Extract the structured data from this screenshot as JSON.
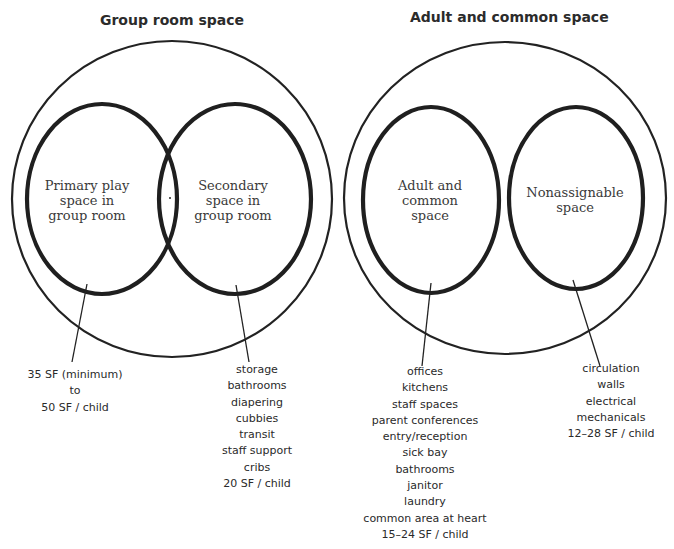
{
  "diagrams": [
    {
      "title": "Group room space",
      "zones": [
        {
          "label": "Primary play\nspace in\ngroup room"
        },
        {
          "label": "Secondary\nspace in\ngroup room"
        }
      ],
      "callouts": [
        {
          "lines": [
            "35 SF (minimum)",
            "to",
            "50 SF / child"
          ]
        },
        {
          "lines": [
            "storage",
            "bathrooms",
            "diapering",
            "cubbies",
            "transit",
            "staff support",
            "cribs",
            "20 SF / child"
          ]
        }
      ]
    },
    {
      "title": "Adult and common space",
      "zones": [
        {
          "label": "Adult and\ncommon\nspace"
        },
        {
          "label": "Nonassignable\nspace"
        }
      ],
      "callouts": [
        {
          "lines": [
            "offices",
            "kitchens",
            "staff spaces",
            "parent conferences",
            "entry/reception",
            "sick bay",
            "bathrooms",
            "janitor",
            "laundry",
            "common area at heart",
            "15–24 SF / child"
          ]
        },
        {
          "lines": [
            "circulation",
            "walls",
            "electrical",
            "mechanicals",
            "12–28 SF / child"
          ]
        }
      ]
    }
  ],
  "colors": {
    "stroke": "#222222",
    "text": "#2a2a2a",
    "background": "#ffffff"
  }
}
